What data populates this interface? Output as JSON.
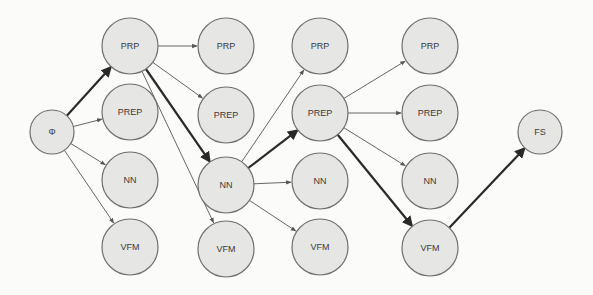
{
  "diagram": {
    "type": "lattice / state-transition graph (Viterbi-style path)",
    "nodes": [
      {
        "id": "start",
        "label": "Φ",
        "x": 52,
        "y": 132,
        "r": 22
      },
      {
        "id": "c1_prp",
        "label": "PRP",
        "x": 130,
        "y": 46,
        "r": 28
      },
      {
        "id": "c1_prep",
        "label": "PREP",
        "x": 130,
        "y": 112,
        "r": 28
      },
      {
        "id": "c1_nn",
        "label": "NN",
        "x": 130,
        "y": 180,
        "r": 28
      },
      {
        "id": "c1_vfm",
        "label": "VFM",
        "x": 130,
        "y": 247,
        "r": 28
      },
      {
        "id": "c2_prp",
        "label": "PRP",
        "x": 226,
        "y": 46,
        "r": 28
      },
      {
        "id": "c2_prep",
        "label": "PREP",
        "x": 226,
        "y": 115,
        "r": 28
      },
      {
        "id": "c2_nn",
        "label": "NN",
        "x": 226,
        "y": 185,
        "r": 28
      },
      {
        "id": "c2_vfm",
        "label": "VFM",
        "x": 226,
        "y": 249,
        "r": 28
      },
      {
        "id": "c3_prp",
        "label": "PRP",
        "x": 320,
        "y": 46,
        "r": 28
      },
      {
        "id": "c3_prep",
        "label": "PREP",
        "x": 320,
        "y": 113,
        "r": 28
      },
      {
        "id": "c3_nn",
        "label": "NN",
        "x": 320,
        "y": 181,
        "r": 28
      },
      {
        "id": "c3_vfm",
        "label": "VFM",
        "x": 320,
        "y": 247,
        "r": 28
      },
      {
        "id": "c4_prp",
        "label": "PRP",
        "x": 430,
        "y": 46,
        "r": 28
      },
      {
        "id": "c4_prep",
        "label": "PREP",
        "x": 430,
        "y": 113,
        "r": 28
      },
      {
        "id": "c4_nn",
        "label": "NN",
        "x": 430,
        "y": 181,
        "r": 28
      },
      {
        "id": "c4_vfm",
        "label": "VFM",
        "x": 430,
        "y": 248,
        "r": 28
      },
      {
        "id": "end",
        "label": "FS",
        "x": 540,
        "y": 132,
        "r": 22
      }
    ],
    "edges": [
      {
        "from": "start",
        "to": "c1_prp",
        "bold": true
      },
      {
        "from": "start",
        "to": "c1_prep",
        "bold": false
      },
      {
        "from": "start",
        "to": "c1_nn",
        "bold": false
      },
      {
        "from": "start",
        "to": "c1_vfm",
        "bold": false
      },
      {
        "from": "c1_prp",
        "to": "c2_prp",
        "bold": false
      },
      {
        "from": "c1_prp",
        "to": "c2_prep",
        "bold": false
      },
      {
        "from": "c1_prp",
        "to": "c2_nn",
        "bold": true
      },
      {
        "from": "c1_prp",
        "to": "c2_vfm",
        "bold": false
      },
      {
        "from": "c2_nn",
        "to": "c3_prp",
        "bold": false
      },
      {
        "from": "c2_nn",
        "to": "c3_prep",
        "bold": true
      },
      {
        "from": "c2_nn",
        "to": "c3_nn",
        "bold": false
      },
      {
        "from": "c2_nn",
        "to": "c3_vfm",
        "bold": false
      },
      {
        "from": "c3_prep",
        "to": "c4_prp",
        "bold": false
      },
      {
        "from": "c3_prep",
        "to": "c4_prep",
        "bold": false
      },
      {
        "from": "c3_prep",
        "to": "c4_nn",
        "bold": false
      },
      {
        "from": "c3_prep",
        "to": "c4_vfm",
        "bold": true
      },
      {
        "from": "c4_vfm",
        "to": "end",
        "bold": true
      }
    ],
    "best_path": [
      "Φ",
      "PRP",
      "NN",
      "PREP",
      "VFM",
      "FS"
    ],
    "colors": {
      "node_fill": "#e6e6e4",
      "node_stroke": "#6f6f6f",
      "edge_thin": "#555555",
      "edge_bold": "#2a2a2a",
      "label": "#3a3a3a",
      "background": "#fbfbfa"
    }
  }
}
